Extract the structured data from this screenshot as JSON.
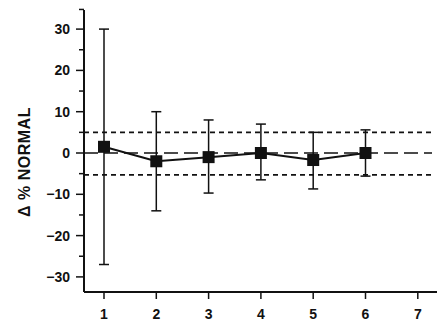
{
  "chart_data": {
    "type": "line",
    "title": "",
    "xlabel": "",
    "ylabel": "Δ % NORMAL",
    "x": [
      1,
      2,
      3,
      4,
      5,
      6
    ],
    "x_ticks": [
      "1",
      "2",
      "3",
      "4",
      "5",
      "6",
      "7"
    ],
    "xlim": [
      0.6,
      7.4
    ],
    "y_ticks": [
      "30",
      "20",
      "10",
      "0",
      "−10",
      "−20",
      "−30"
    ],
    "y_tick_values": [
      30,
      20,
      10,
      0,
      -10,
      -20,
      -30
    ],
    "ylim": [
      -33,
      35
    ],
    "grid": false,
    "legend": null,
    "series": [
      {
        "name": "mean",
        "marker": "filled-square",
        "values": [
          1.5,
          -2.0,
          -1.0,
          0.0,
          -1.7,
          0.0
        ],
        "error_upper": [
          30.0,
          10.0,
          8.0,
          7.0,
          5.0,
          5.6
        ],
        "error_lower": [
          -27.0,
          -14.0,
          -9.7,
          -6.5,
          -8.7,
          -5.6
        ]
      }
    ],
    "reference_lines": [
      {
        "y": 5,
        "style": "dotted",
        "label": "upper normal limit"
      },
      {
        "y": 0,
        "style": "dashed",
        "label": "zero"
      },
      {
        "y": -5.3,
        "style": "dotted",
        "label": "lower normal limit"
      }
    ]
  },
  "colors": {
    "ink": "#111111",
    "background": "#ffffff"
  }
}
